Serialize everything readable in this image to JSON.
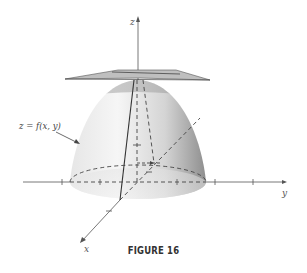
{
  "figure": {
    "caption": "FIGURE 16",
    "surface_label": "z = f(x, y)",
    "axes": {
      "x_label": "x",
      "y_label": "y",
      "z_label": "z"
    },
    "colors": {
      "surface_light": "#f2f2f2",
      "surface_mid": "#cfcfcf",
      "surface_dark": "#9a9a9a",
      "cap_band": "#b8b8b8",
      "plane": "#c8c8c8",
      "axis": "#555555",
      "dashed": "#444444"
    }
  }
}
